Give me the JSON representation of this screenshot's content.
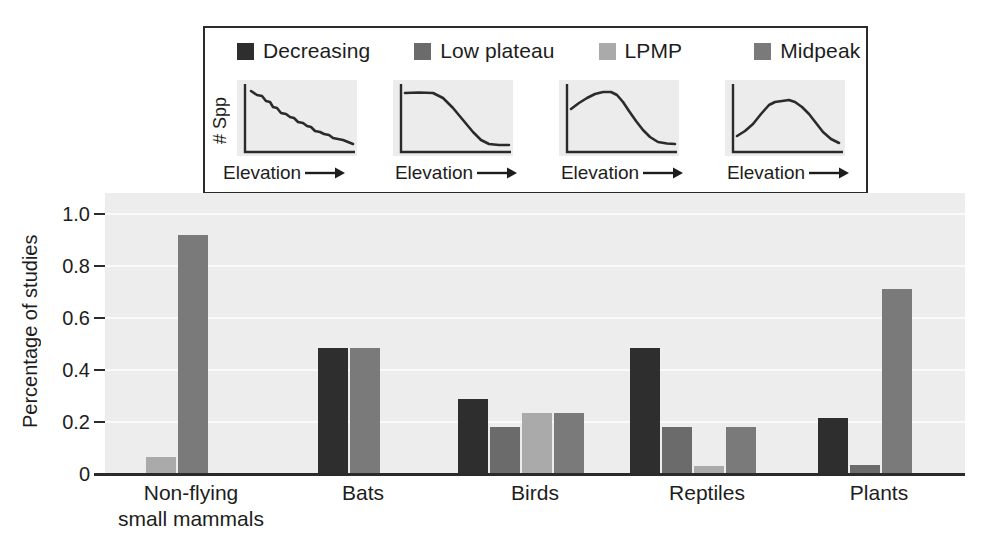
{
  "chart_data": {
    "type": "bar",
    "title": "",
    "subtitle": "",
    "xlabel": "",
    "ylabel": "Percentage of studies",
    "ylim": [
      0,
      1.08
    ],
    "yticks": [
      0,
      0.2,
      0.4,
      0.6,
      0.8,
      1.0
    ],
    "ytick_labels": [
      "0",
      "0.2",
      "0.4",
      "0.6",
      "0.8",
      "1.0"
    ],
    "grid": "horizontal-white",
    "legend_position": "top-inset-box",
    "grouping": "grouped",
    "categories": [
      "Non-flying\nsmall mammals",
      "Bats",
      "Birds",
      "Reptiles",
      "Plants"
    ],
    "series": [
      {
        "name": "Decreasing",
        "color": "#2e2e2e",
        "values": [
          0,
          0.485,
          0.29,
          0.485,
          0.215
        ]
      },
      {
        "name": "Low plateau",
        "color": "#6b6b6b",
        "values": [
          0,
          0,
          0.18,
          0.18,
          0.035
        ]
      },
      {
        "name": "LPMP",
        "color": "#aaaaaa",
        "values": [
          0.065,
          0,
          0.235,
          0.03,
          0
        ]
      },
      {
        "name": "Midpeak",
        "color": "#7a7a7a",
        "values": [
          0.92,
          0.485,
          0.235,
          0.18,
          0.71
        ]
      }
    ],
    "annotations": []
  },
  "legend": {
    "entries": [
      {
        "label": "Decreasing",
        "swatch_color": "#2e2e2e"
      },
      {
        "label": "Low plateau",
        "swatch_color": "#6b6b6b"
      },
      {
        "label": "LPMP",
        "swatch_color": "#aaaaaa"
      },
      {
        "label": "Midpeak",
        "swatch_color": "#7a7a7a"
      }
    ],
    "mini_panels": [
      {
        "pattern_name": "Decreasing",
        "ylabel": "# Spp",
        "xlabel": "Elevation",
        "show_ylabel": true,
        "curve": "monotonic decline from high left to low right"
      },
      {
        "pattern_name": "Low plateau",
        "ylabel": "# Spp",
        "xlabel": "Elevation",
        "show_ylabel": false,
        "curve": "flat at high values then steep decline to low right"
      },
      {
        "pattern_name": "LPMP",
        "ylabel": "# Spp",
        "xlabel": "Elevation",
        "show_ylabel": false,
        "curve": "rises to an early-mid peak then declines to low right"
      },
      {
        "pattern_name": "Midpeak",
        "ylabel": "# Spp",
        "xlabel": "Elevation",
        "show_ylabel": false,
        "curve": "low at both ends with a peak near the middle"
      }
    ]
  },
  "axes": {
    "y_title": "Percentage of studies",
    "y_tick_labels": [
      "1.0",
      "0.8",
      "0.6",
      "0.4",
      "0.2",
      "0"
    ],
    "x_tick_labels": [
      "Non-flying\nsmall mammals",
      "Bats",
      "Birds",
      "Reptiles",
      "Plants"
    ]
  },
  "style": {
    "plot_background": "#ededed",
    "gridline_color": "#fafafa",
    "axis_color": "#2b2b2b",
    "text_color": "#1d1d1d",
    "page_background": "#ffffff"
  }
}
